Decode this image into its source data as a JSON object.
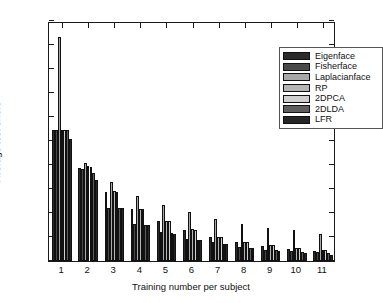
{
  "chart_data": {
    "type": "bar",
    "title": "",
    "xlabel": "Training number per subject",
    "ylabel": "Average test errors",
    "categories": [
      "1",
      "2",
      "3",
      "4",
      "5",
      "6",
      "7",
      "8",
      "9",
      "10",
      "11"
    ],
    "ylim": [
      0,
      1
    ],
    "yticks": [
      "0",
      "0.1",
      "0.2",
      "0.3",
      "0.4",
      "0.5",
      "0.6",
      "0.7",
      "0.8",
      "0.9",
      "1"
    ],
    "grid": false,
    "legend_position": "top-right",
    "series": [
      {
        "name": "Eigenface",
        "color": "#2b2b2b",
        "values": [
          0.545,
          0.386,
          0.289,
          0.216,
          0.165,
          0.131,
          0.099,
          0.079,
          0.063,
          0.05,
          0.043
        ]
      },
      {
        "name": "Fisherface",
        "color": "#4a4a4a",
        "values": [
          0.545,
          0.383,
          0.222,
          0.154,
          0.119,
          0.093,
          0.079,
          0.06,
          0.047,
          0.042,
          0.038
        ]
      },
      {
        "name": "Laplacianface",
        "color": "#a8a8a8",
        "values": [
          0.932,
          0.41,
          0.33,
          0.272,
          0.234,
          0.206,
          0.175,
          0.156,
          0.139,
          0.129,
          0.114
        ]
      },
      {
        "name": "RP",
        "color": "#b5b5b5",
        "values": [
          0.545,
          0.394,
          0.291,
          0.216,
          0.166,
          0.134,
          0.102,
          0.081,
          0.067,
          0.056,
          0.046
        ]
      },
      {
        "name": "2DPCA",
        "color": "#cfcfcf",
        "values": [
          0.545,
          0.391,
          0.289,
          0.216,
          0.165,
          0.131,
          0.101,
          0.08,
          0.066,
          0.055,
          0.044
        ]
      },
      {
        "name": "2DLDA",
        "color": "#5e5e5e",
        "values": [
          0.545,
          0.365,
          0.222,
          0.152,
          0.115,
          0.089,
          0.072,
          0.056,
          0.044,
          0.037,
          0.032
        ]
      },
      {
        "name": "LFR",
        "color": "#262626",
        "values": [
          0.507,
          0.339,
          0.219,
          0.149,
          0.113,
          0.088,
          0.069,
          0.054,
          0.042,
          0.035,
          0.027
        ]
      }
    ]
  },
  "legend": {
    "items": [
      "Eigenface",
      "Fisherface",
      "Laplacianface",
      "RP",
      "2DPCA",
      "2DLDA",
      "LFR"
    ]
  }
}
